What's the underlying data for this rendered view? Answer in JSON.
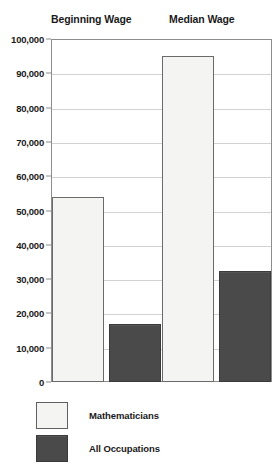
{
  "chart_data": {
    "type": "bar",
    "title": "",
    "subtitle": "",
    "xlabel": "",
    "ylabel": "",
    "categories": [
      "Beginning Wage",
      "Median Wage"
    ],
    "series": [
      {
        "name": "Mathematicians",
        "color": "#f4f4f2",
        "values": [
          54000,
          95000
        ]
      },
      {
        "name": "All Occupations",
        "color": "#4a4a4a",
        "values": [
          17000,
          32500
        ]
      }
    ],
    "ylim": [
      0,
      100000
    ],
    "ytick_values": [
      0,
      10000,
      20000,
      30000,
      40000,
      50000,
      60000,
      70000,
      80000,
      90000,
      100000
    ],
    "ytick_labels": [
      "0",
      "10,000",
      "20,000",
      "30,000",
      "40,000",
      "50,000",
      "60,000",
      "70,000",
      "80,000",
      "90,000",
      "100,000"
    ],
    "grid": true,
    "grid_axis": "y",
    "legend_position": "bottom-left",
    "bar_order": [
      {
        "group": "Beginning Wage",
        "series": "Mathematicians",
        "value": 54000
      },
      {
        "group": "Beginning Wage",
        "series": "All Occupations",
        "value": 17000
      },
      {
        "group": "Median Wage",
        "series": "Mathematicians",
        "value": 95000
      },
      {
        "group": "Median Wage",
        "series": "All Occupations",
        "value": 32500
      }
    ]
  },
  "headers": [
    {
      "label": "Beginning Wage"
    },
    {
      "label": "Median Wage"
    }
  ],
  "legend": {
    "items": [
      {
        "label": "Mathematicians",
        "swatch": "light-swatch"
      },
      {
        "label": "All Occupations",
        "swatch": "dark-swatch"
      }
    ]
  },
  "colors": {
    "light_fill": "#f4f4f2",
    "dark_fill": "#4a4a4a",
    "frame": "#8d8d8d",
    "gridline": "#d2d2d2",
    "text": "#1a1a1a"
  }
}
